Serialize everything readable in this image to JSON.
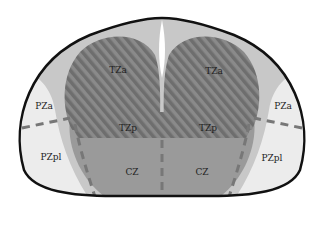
{
  "diagram": {
    "type": "prostate-zonal-anatomy-axial",
    "colors": {
      "outline": "#111111",
      "fibromuscular_stroma": "#c8c8c8",
      "transition_zone": "#7a7a7a",
      "central_zone": "#9a9a9a",
      "peripheral_zone": "#ececec",
      "dashed_line": "#777777"
    },
    "labels": {
      "tza_left": "TZa",
      "tza_right": "TZa",
      "pza_left": "PZa",
      "pza_right": "PZa",
      "tzp_left": "TZp",
      "tzp_right": "TZp",
      "pzpl_left": "PZpl",
      "pzpl_right": "PZpl",
      "cz_left": "CZ",
      "cz_right": "CZ"
    }
  }
}
